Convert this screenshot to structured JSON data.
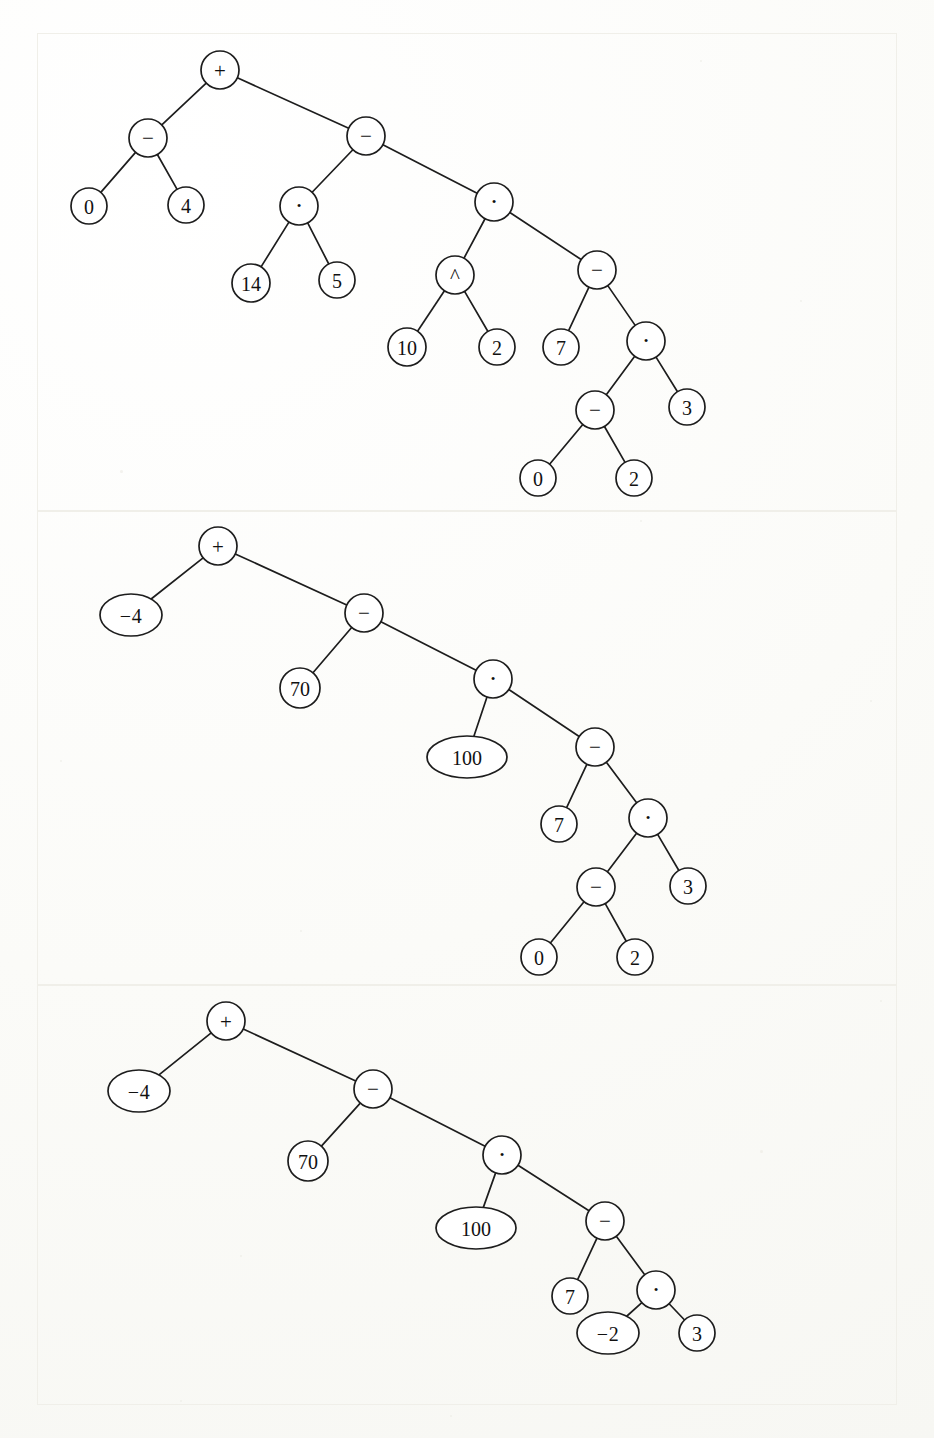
{
  "page": {
    "background_color": "#fdfdfb",
    "ink_color": "#1d1d1d",
    "panel_border_color": "#f0efe9",
    "figure_kind": "expression-trees",
    "panel_count": 3
  },
  "trees": [
    {
      "id": "tree-1",
      "caption": "",
      "nodes": [
        {
          "id": "t1n1",
          "label": "+",
          "kind": "operator",
          "shape": "circle",
          "cx": 220,
          "cy": 70,
          "rx": 19,
          "ry": 19
        },
        {
          "id": "t1n2",
          "label": "−",
          "kind": "operator",
          "shape": "circle",
          "cx": 148,
          "cy": 138,
          "rx": 19,
          "ry": 19
        },
        {
          "id": "t1n3",
          "label": "−",
          "kind": "operator",
          "shape": "circle",
          "cx": 366,
          "cy": 136,
          "rx": 19,
          "ry": 19
        },
        {
          "id": "t1n4",
          "label": "0",
          "kind": "number",
          "shape": "circle",
          "cx": 89,
          "cy": 206,
          "rx": 18,
          "ry": 18
        },
        {
          "id": "t1n5",
          "label": "4",
          "kind": "number",
          "shape": "circle",
          "cx": 186,
          "cy": 205,
          "rx": 18,
          "ry": 18
        },
        {
          "id": "t1n6",
          "label": "·",
          "kind": "operator",
          "shape": "circle",
          "cx": 299,
          "cy": 206,
          "rx": 19,
          "ry": 19
        },
        {
          "id": "t1n7",
          "label": "·",
          "kind": "operator",
          "shape": "circle",
          "cx": 494,
          "cy": 202,
          "rx": 19,
          "ry": 19
        },
        {
          "id": "t1n8",
          "label": "14",
          "kind": "number",
          "shape": "circle",
          "cx": 251,
          "cy": 283,
          "rx": 19,
          "ry": 19
        },
        {
          "id": "t1n9",
          "label": "5",
          "kind": "number",
          "shape": "circle",
          "cx": 337,
          "cy": 280,
          "rx": 18,
          "ry": 18
        },
        {
          "id": "t1n10",
          "label": "^",
          "kind": "operator",
          "shape": "circle",
          "cx": 455,
          "cy": 275,
          "rx": 19,
          "ry": 19
        },
        {
          "id": "t1n11",
          "label": "−",
          "kind": "operator",
          "shape": "circle",
          "cx": 597,
          "cy": 270,
          "rx": 19,
          "ry": 19
        },
        {
          "id": "t1n12",
          "label": "10",
          "kind": "number",
          "shape": "circle",
          "cx": 407,
          "cy": 347,
          "rx": 19,
          "ry": 19
        },
        {
          "id": "t1n13",
          "label": "2",
          "kind": "number",
          "shape": "circle",
          "cx": 497,
          "cy": 347,
          "rx": 18,
          "ry": 18
        },
        {
          "id": "t1n14",
          "label": "7",
          "kind": "number",
          "shape": "circle",
          "cx": 561,
          "cy": 347,
          "rx": 18,
          "ry": 18
        },
        {
          "id": "t1n15",
          "label": "·",
          "kind": "operator",
          "shape": "circle",
          "cx": 646,
          "cy": 341,
          "rx": 19,
          "ry": 19
        },
        {
          "id": "t1n16",
          "label": "−",
          "kind": "operator",
          "shape": "circle",
          "cx": 595,
          "cy": 410,
          "rx": 19,
          "ry": 19
        },
        {
          "id": "t1n17",
          "label": "3",
          "kind": "number",
          "shape": "circle",
          "cx": 687,
          "cy": 407,
          "rx": 18,
          "ry": 18
        },
        {
          "id": "t1n18",
          "label": "0",
          "kind": "number",
          "shape": "circle",
          "cx": 538,
          "cy": 478,
          "rx": 18,
          "ry": 18
        },
        {
          "id": "t1n19",
          "label": "2",
          "kind": "number",
          "shape": "circle",
          "cx": 634,
          "cy": 478,
          "rx": 18,
          "ry": 18
        }
      ],
      "edges": [
        [
          "t1n1",
          "t1n2"
        ],
        [
          "t1n1",
          "t1n3"
        ],
        [
          "t1n2",
          "t1n4"
        ],
        [
          "t1n2",
          "t1n5"
        ],
        [
          "t1n3",
          "t1n6"
        ],
        [
          "t1n3",
          "t1n7"
        ],
        [
          "t1n6",
          "t1n8"
        ],
        [
          "t1n6",
          "t1n9"
        ],
        [
          "t1n7",
          "t1n10"
        ],
        [
          "t1n7",
          "t1n11"
        ],
        [
          "t1n10",
          "t1n12"
        ],
        [
          "t1n10",
          "t1n13"
        ],
        [
          "t1n11",
          "t1n14"
        ],
        [
          "t1n11",
          "t1n15"
        ],
        [
          "t1n15",
          "t1n16"
        ],
        [
          "t1n15",
          "t1n17"
        ],
        [
          "t1n16",
          "t1n18"
        ],
        [
          "t1n16",
          "t1n19"
        ]
      ]
    },
    {
      "id": "tree-2",
      "caption": "",
      "nodes": [
        {
          "id": "t2n1",
          "label": "+",
          "kind": "operator",
          "shape": "circle",
          "cx": 218,
          "cy": 546,
          "rx": 19,
          "ry": 19
        },
        {
          "id": "t2n2",
          "label": "−4",
          "kind": "number",
          "shape": "ellipse",
          "cx": 131,
          "cy": 615,
          "rx": 31,
          "ry": 21
        },
        {
          "id": "t2n3",
          "label": "−",
          "kind": "operator",
          "shape": "circle",
          "cx": 364,
          "cy": 613,
          "rx": 19,
          "ry": 19
        },
        {
          "id": "t2n4",
          "label": "70",
          "kind": "number",
          "shape": "circle",
          "cx": 300,
          "cy": 688,
          "rx": 20,
          "ry": 20
        },
        {
          "id": "t2n5",
          "label": "·",
          "kind": "operator",
          "shape": "circle",
          "cx": 493,
          "cy": 679,
          "rx": 19,
          "ry": 19
        },
        {
          "id": "t2n6",
          "label": "100",
          "kind": "number",
          "shape": "ellipse",
          "cx": 467,
          "cy": 757,
          "rx": 40,
          "ry": 21
        },
        {
          "id": "t2n7",
          "label": "−",
          "kind": "operator",
          "shape": "circle",
          "cx": 595,
          "cy": 747,
          "rx": 19,
          "ry": 19
        },
        {
          "id": "t2n8",
          "label": "7",
          "kind": "number",
          "shape": "circle",
          "cx": 559,
          "cy": 824,
          "rx": 18,
          "ry": 18
        },
        {
          "id": "t2n9",
          "label": "·",
          "kind": "operator",
          "shape": "circle",
          "cx": 648,
          "cy": 818,
          "rx": 19,
          "ry": 19
        },
        {
          "id": "t2n10",
          "label": "−",
          "kind": "operator",
          "shape": "circle",
          "cx": 596,
          "cy": 887,
          "rx": 19,
          "ry": 19
        },
        {
          "id": "t2n11",
          "label": "3",
          "kind": "number",
          "shape": "circle",
          "cx": 688,
          "cy": 886,
          "rx": 18,
          "ry": 18
        },
        {
          "id": "t2n12",
          "label": "0",
          "kind": "number",
          "shape": "circle",
          "cx": 539,
          "cy": 957,
          "rx": 18,
          "ry": 18
        },
        {
          "id": "t2n13",
          "label": "2",
          "kind": "number",
          "shape": "circle",
          "cx": 635,
          "cy": 957,
          "rx": 18,
          "ry": 18
        }
      ],
      "edges": [
        [
          "t2n1",
          "t2n2"
        ],
        [
          "t2n1",
          "t2n3"
        ],
        [
          "t2n3",
          "t2n4"
        ],
        [
          "t2n3",
          "t2n5"
        ],
        [
          "t2n5",
          "t2n6"
        ],
        [
          "t2n5",
          "t2n7"
        ],
        [
          "t2n7",
          "t2n8"
        ],
        [
          "t2n7",
          "t2n9"
        ],
        [
          "t2n9",
          "t2n10"
        ],
        [
          "t2n9",
          "t2n11"
        ],
        [
          "t2n10",
          "t2n12"
        ],
        [
          "t2n10",
          "t2n13"
        ]
      ]
    },
    {
      "id": "tree-3",
      "caption": "",
      "nodes": [
        {
          "id": "t3n1",
          "label": "+",
          "kind": "operator",
          "shape": "circle",
          "cx": 226,
          "cy": 1021,
          "rx": 19,
          "ry": 19
        },
        {
          "id": "t3n2",
          "label": "−4",
          "kind": "number",
          "shape": "ellipse",
          "cx": 139,
          "cy": 1091,
          "rx": 31,
          "ry": 21
        },
        {
          "id": "t3n3",
          "label": "−",
          "kind": "operator",
          "shape": "circle",
          "cx": 373,
          "cy": 1089,
          "rx": 19,
          "ry": 19
        },
        {
          "id": "t3n4",
          "label": "70",
          "kind": "number",
          "shape": "circle",
          "cx": 308,
          "cy": 1161,
          "rx": 20,
          "ry": 20
        },
        {
          "id": "t3n5",
          "label": "·",
          "kind": "operator",
          "shape": "circle",
          "cx": 502,
          "cy": 1155,
          "rx": 19,
          "ry": 19
        },
        {
          "id": "t3n6",
          "label": "100",
          "kind": "number",
          "shape": "ellipse",
          "cx": 476,
          "cy": 1228,
          "rx": 40,
          "ry": 21
        },
        {
          "id": "t3n7",
          "label": "−",
          "kind": "operator",
          "shape": "circle",
          "cx": 605,
          "cy": 1221,
          "rx": 19,
          "ry": 19
        },
        {
          "id": "t3n8",
          "label": "7",
          "kind": "number",
          "shape": "circle",
          "cx": 570,
          "cy": 1296,
          "rx": 18,
          "ry": 18
        },
        {
          "id": "t3n9",
          "label": "·",
          "kind": "operator",
          "shape": "circle",
          "cx": 656,
          "cy": 1290,
          "rx": 19,
          "ry": 19
        },
        {
          "id": "t3n10",
          "label": "−2",
          "kind": "number",
          "shape": "ellipse",
          "cx": 608,
          "cy": 1333,
          "rx": 31,
          "ry": 21
        },
        {
          "id": "t3n11",
          "label": "3",
          "kind": "number",
          "shape": "circle",
          "cx": 697,
          "cy": 1333,
          "rx": 18,
          "ry": 18
        }
      ],
      "edges": [
        [
          "t3n1",
          "t3n2"
        ],
        [
          "t3n1",
          "t3n3"
        ],
        [
          "t3n3",
          "t3n4"
        ],
        [
          "t3n3",
          "t3n5"
        ],
        [
          "t3n5",
          "t3n6"
        ],
        [
          "t3n5",
          "t3n7"
        ],
        [
          "t3n7",
          "t3n8"
        ],
        [
          "t3n7",
          "t3n9"
        ],
        [
          "t3n9",
          "t3n10"
        ],
        [
          "t3n9",
          "t3n11"
        ]
      ]
    }
  ]
}
